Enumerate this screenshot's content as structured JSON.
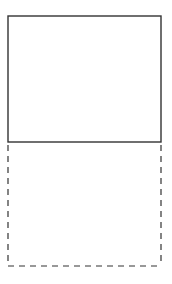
{
  "canvas": {
    "width": 172,
    "height": 284,
    "background": "#ffffff"
  },
  "diagram": {
    "stroke_color": "#333333",
    "solid_box": {
      "x": 8,
      "y": 16,
      "width": 153,
      "height": 126,
      "style": "solid"
    },
    "dashed_box": {
      "x": 8,
      "y": 142,
      "width": 153,
      "height": 124,
      "style": "dashed",
      "dash": "6,5"
    }
  }
}
